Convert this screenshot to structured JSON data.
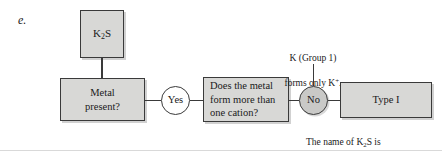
{
  "item": {
    "letter": "e."
  },
  "flow": {
    "compound_box": {
      "formula_prefix": "K",
      "formula_sub": "2",
      "formula_suffix": "S",
      "label": "K2S"
    },
    "metal_box": {
      "line1": "Metal",
      "line2": "present?",
      "label": "Metal present?"
    },
    "yes_node": {
      "label": "Yes"
    },
    "cation_box": {
      "line1": "Does the metal",
      "line2": "form more than",
      "line3": "one cation?",
      "label": "Does the metal form more than one cation?"
    },
    "no_node": {
      "label": "No"
    },
    "type_box": {
      "label": "Type I"
    }
  },
  "annotations": {
    "group_note": {
      "line1": "K (Group 1)",
      "line2_prefix": "forms only K",
      "line2_sup": "+",
      "line2_suffix": ".",
      "text": "K (Group 1) forms only K+."
    },
    "name_note": {
      "line1_prefix": "The name of K",
      "line1_sub": "2",
      "line1_suffix": "S is",
      "line2": "potassium sulfide.",
      "text": "The name of K2S is potassium sulfide."
    }
  },
  "colors": {
    "box_fill": "#d8d8d6",
    "no_fill": "#c9c9c7",
    "yes_fill": "#ffffff",
    "stroke": "#3a3a3a",
    "text": "#1a1a1a",
    "rule": "#d9d9d9"
  }
}
